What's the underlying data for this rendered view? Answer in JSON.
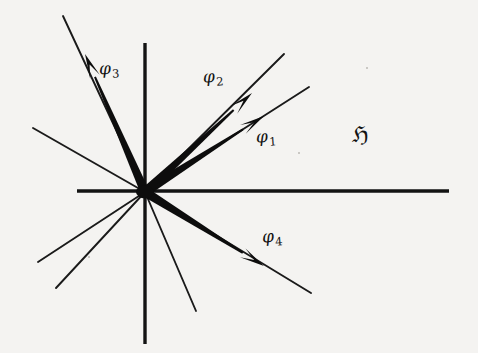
{
  "figure": {
    "kind": "vector-diagram",
    "background_color": "#f4f3f1",
    "ink_color": "#121212",
    "width": 478,
    "height": 353,
    "origin": {
      "x": 145,
      "y": 192
    },
    "space_label": "ℌ",
    "space_label_name": "fraktur-capital-h"
  },
  "axes": [
    {
      "name": "horizontal-axis",
      "label": "",
      "x1": 77,
      "y1": 191,
      "x2": 449,
      "y2": 191
    },
    {
      "name": "vertical-axis",
      "label": "",
      "x1": 145,
      "y1": 43,
      "x2": 145,
      "y2": 344
    }
  ],
  "rays": [
    {
      "name": "ray-upper-left",
      "x1": 145,
      "y1": 192,
      "x2": 33,
      "y2": 128
    },
    {
      "name": "ray-lower-left-upper",
      "x1": 145,
      "y1": 192,
      "x2": 38,
      "y2": 262
    },
    {
      "name": "ray-lower-left-lower",
      "x1": 145,
      "y1": 192,
      "x2": 56,
      "y2": 288
    },
    {
      "name": "ray-lower-center",
      "x1": 145,
      "y1": 192,
      "x2": 196,
      "y2": 311
    },
    {
      "name": "ray-phi1-extension",
      "x1": 145,
      "y1": 192,
      "x2": 309,
      "y2": 87
    },
    {
      "name": "ray-phi2-extension",
      "x1": 145,
      "y1": 192,
      "x2": 284,
      "y2": 54
    },
    {
      "name": "ray-phi3-extension",
      "x1": 145,
      "y1": 192,
      "x2": 63,
      "y2": 16
    },
    {
      "name": "ray-phi4-extension",
      "x1": 145,
      "y1": 192,
      "x2": 311,
      "y2": 293
    }
  ],
  "vectors": [
    {
      "name": "vector-phi1",
      "label": "φ",
      "subscript": "1",
      "x1": 145,
      "y1": 192,
      "x2": 264,
      "y2": 116,
      "angle_deg": 32.6
    },
    {
      "name": "vector-phi2",
      "label": "φ",
      "subscript": "2",
      "x1": 145,
      "y1": 192,
      "x2": 252,
      "y2": 93,
      "angle_deg": 42.8
    },
    {
      "name": "vector-phi3",
      "label": "φ",
      "subscript": "3",
      "x1": 145,
      "y1": 192,
      "x2": 85,
      "y2": 54,
      "angle_deg": 113.5
    },
    {
      "name": "vector-phi4",
      "label": "φ",
      "subscript": "4",
      "x1": 145,
      "y1": 192,
      "x2": 264,
      "y2": 266,
      "angle_deg": -31.9
    }
  ],
  "specks": [
    {
      "name": "speck-upper-right",
      "x": 366,
      "y": 67,
      "d": 2
    },
    {
      "name": "speck-mid-left",
      "x": 88,
      "y": 256,
      "d": 2
    },
    {
      "name": "speck-lower-right",
      "x": 298,
      "y": 152,
      "d": 2
    }
  ]
}
